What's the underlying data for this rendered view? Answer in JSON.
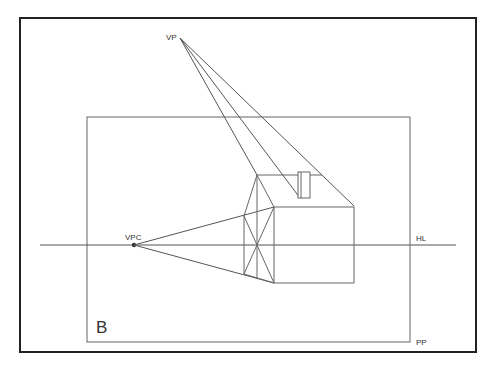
{
  "diagram": {
    "type": "one-point-perspective-house",
    "colors": {
      "background": "#ffffff",
      "frame": "#222222",
      "line": "#555555",
      "label": "#333333"
    },
    "labels": {
      "vanishing_point": "VP",
      "center_vanishing_point": "VPC",
      "horizon_line": "HL",
      "picture_plane": "PP",
      "panel_letter": "B"
    },
    "geometry": {
      "outer_frame": {
        "x": 20,
        "y": 18,
        "w": 456,
        "h": 334
      },
      "picture_plane": {
        "x": 87,
        "y": 117,
        "w": 323,
        "h": 225
      },
      "horizon_y": 245,
      "horizon_x1": 40,
      "horizon_x2": 456,
      "vp": {
        "x": 180,
        "y": 38
      },
      "vpc": {
        "x": 134,
        "y": 245
      }
    }
  }
}
